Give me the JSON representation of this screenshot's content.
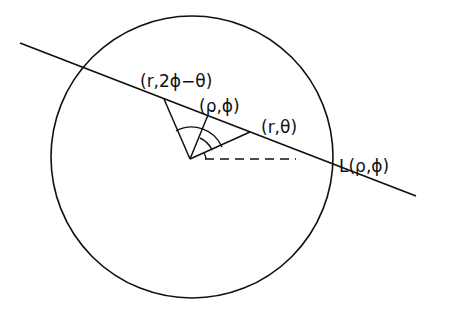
{
  "diagram": {
    "labels": {
      "reflected_point": "(r,2ϕ−θ)",
      "foot_point": "(ρ,ϕ)",
      "point": "(r,θ)",
      "line": "L(ρ,ϕ)"
    },
    "colors": {
      "stroke": "#111111",
      "background": "#ffffff"
    }
  }
}
